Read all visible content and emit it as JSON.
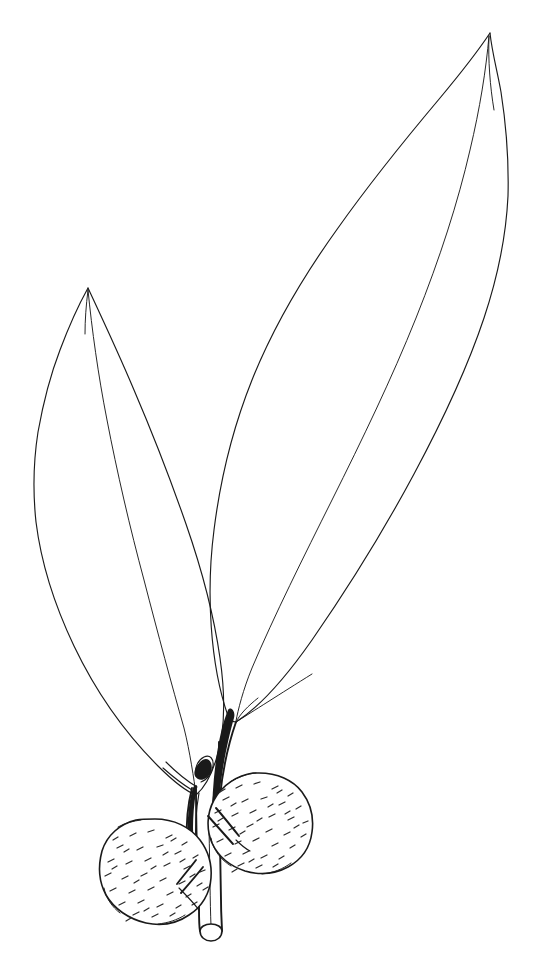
{
  "figure": {
    "kind": "botanical-line-drawing",
    "background_color": "#ffffff",
    "ink_color": "#1a1a1a",
    "canvas": {
      "width": 538,
      "height": 961
    },
    "technique": "pen-and-ink outline with short-dash stippling",
    "caption": "",
    "labels": []
  },
  "parts": {
    "leaf_upper_right": {
      "name": "upper right leaf",
      "shape": "elliptic-lanceolate, acuminate apex",
      "apex_point": "490,33",
      "base_point": "236,722",
      "widest_x": 507,
      "has_midrib": true
    },
    "leaf_lower_left": {
      "name": "lower left leaf",
      "shape": "narrowly lanceolate, acuminate apex",
      "apex_point": "88,288",
      "base_point": "196,795",
      "widest_x": 34,
      "has_midrib": true
    },
    "stem": {
      "name": "woody twig",
      "orientation": "vertical, cut at base",
      "cut_end_y": 935
    },
    "pulvinus_left": {
      "name": "left leaf pulvinus",
      "style": "thickened dark swelling"
    },
    "pulvinus_right": {
      "name": "right leaf pulvinus",
      "style": "thickened dark swelling"
    },
    "bud": {
      "name": "axillary bud",
      "position": "between the two pulvini"
    },
    "fruit_left": {
      "name": "left fruit",
      "form": "globose berry",
      "center": "155,871",
      "radius": 52,
      "surface": "minutely hairy / stippled",
      "pedicel": true
    },
    "fruit_right": {
      "name": "right fruit",
      "form": "globose berry",
      "center": "259,822",
      "radius": 49,
      "surface": "minutely hairy / stippled",
      "pedicel": true
    }
  },
  "geometry": {
    "leaf_upper_right_outline": "M490,33 C470,70 450,96 434,120 C402,168 362,228 324,292 C288,352 262,420 246,490 C236,546 232,634 236,722 C252,700 282,650 314,594 C352,528 400,442 440,362 C470,300 492,246 502,196 C512,148 506,86 490,33 Z",
    "leaf_upper_right_midrib": "M490,33 C478,80 460,146 436,222 C410,306 372,408 330,506 C300,578 266,664 236,722",
    "leaf_lower_left_outline": "M88,288 C72,320 58,360 48,408 C38,458 34,502 36,540 C40,598 62,664 98,718 C130,764 166,788 196,795 C182,766 162,720 146,670 C128,614 116,552 108,488 C100,420 94,348 88,288 Z",
    "leaf_lower_left_midrib": "M88,288 C96,352 106,430 118,504 C132,586 152,672 174,736 C182,760 190,782 196,795",
    "stem_left_edge": "M190,797 C194,840 198,884 200,930",
    "stem_right_edge": "M216,756 C218,808 220,872 222,930",
    "stem_cut_ellipse": {
      "cx": 211,
      "cy": 931,
      "rx": 12,
      "ry": 5
    }
  },
  "stippling": {
    "description": "short slanted dashes suggesting a finely pubescent fruit surface",
    "dash_count_left": 46,
    "dash_count_right": 44
  }
}
